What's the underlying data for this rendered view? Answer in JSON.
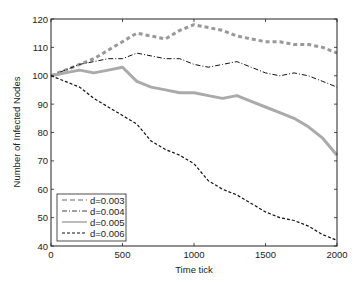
{
  "chart_data": {
    "type": "line",
    "title": "",
    "xlabel": "Time tick",
    "ylabel": "Number of Infected Nodes",
    "xlim": [
      0,
      2000
    ],
    "ylim": [
      40,
      120
    ],
    "xticks": [
      0,
      500,
      1000,
      1500,
      2000
    ],
    "yticks": [
      40,
      50,
      60,
      70,
      80,
      90,
      100,
      110,
      120
    ],
    "grid": false,
    "legend_position": "lower left",
    "x": [
      0,
      100,
      200,
      300,
      400,
      500,
      600,
      700,
      800,
      900,
      1000,
      1100,
      1200,
      1300,
      1400,
      1500,
      1600,
      1700,
      1800,
      1900,
      2000
    ],
    "series": [
      {
        "name": "d=0.003",
        "style": "dashed",
        "color": "#999999",
        "width": 3,
        "values": [
          100,
          102,
          104,
          106,
          109,
          112,
          115,
          114,
          113,
          116,
          118,
          117,
          116,
          114,
          113,
          112,
          112,
          111,
          111,
          110,
          108
        ]
      },
      {
        "name": "d=0.004",
        "style": "dashdot",
        "color": "#111111",
        "width": 1,
        "values": [
          100,
          102,
          104,
          105,
          106,
          106,
          108,
          107,
          106,
          106,
          104,
          103,
          104,
          105,
          103,
          101,
          100,
          101,
          100,
          98,
          96
        ]
      },
      {
        "name": "d=0.005",
        "style": "solid",
        "color": "#aaaaaa",
        "width": 3,
        "values": [
          100,
          101,
          102,
          101,
          102,
          103,
          98,
          96,
          95,
          94,
          94,
          93,
          92,
          93,
          91,
          89,
          87,
          85,
          82,
          78,
          72
        ]
      },
      {
        "name": "d=0.006",
        "style": "dashed",
        "color": "#111111",
        "width": 1.2,
        "values": [
          100,
          98,
          96,
          92,
          89,
          86,
          83,
          77,
          74,
          72,
          69,
          63,
          60,
          58,
          55,
          52,
          50,
          49,
          47,
          44,
          42
        ]
      }
    ]
  },
  "labels": {
    "xlabel": "Time tick",
    "ylabel": "Number of Infected Nodes",
    "xticks": [
      "0",
      "500",
      "1000",
      "1500",
      "2000"
    ],
    "yticks": [
      "40",
      "50",
      "60",
      "70",
      "80",
      "90",
      "100",
      "110",
      "120"
    ],
    "legend": [
      "d=0.003",
      "d=0.004",
      "d=0.005",
      "d=0.006"
    ]
  }
}
